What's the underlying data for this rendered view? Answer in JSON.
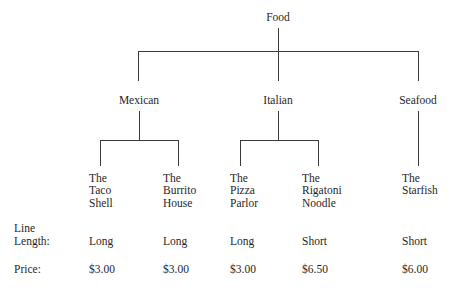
{
  "diagram": {
    "root": {
      "label": "Food",
      "x": 278,
      "y": 12
    },
    "level1": [
      {
        "label": "Mexican",
        "x": 139,
        "y": 95
      },
      {
        "label": "Italian",
        "x": 278,
        "y": 95
      },
      {
        "label": "Seafood",
        "x": 418,
        "y": 95
      }
    ],
    "leaves": [
      {
        "lines": [
          "The",
          "Taco",
          "Shell"
        ],
        "x": 89,
        "y": 172,
        "parent": "Mexican",
        "stem_x": 100
      },
      {
        "lines": [
          "The",
          "Burrito",
          "House"
        ],
        "x": 163,
        "y": 172,
        "parent": "Mexican",
        "stem_x": 178
      },
      {
        "lines": [
          "The",
          "Pizza",
          "Parlor"
        ],
        "x": 230,
        "y": 172,
        "parent": "Italian",
        "stem_x": 240
      },
      {
        "lines": [
          "The",
          "Rigatoni",
          "Noodle"
        ],
        "x": 302,
        "y": 172,
        "parent": "Italian",
        "stem_x": 318
      },
      {
        "lines": [
          "The",
          "Starfish"
        ],
        "x": 402,
        "y": 172,
        "parent": "Seafood",
        "stem_x": 418
      }
    ]
  },
  "table": {
    "row_labels": {
      "line_length_1": "Line",
      "line_length_2": "Length:",
      "price": "Price:"
    },
    "columns": [
      {
        "name": "The Taco Shell",
        "line_length": "Long",
        "price": "$3.00",
        "x": 89
      },
      {
        "name": "The Burrito House",
        "line_length": "Long",
        "price": "$3.00",
        "x": 163
      },
      {
        "name": "The Pizza Parlor",
        "line_length": "Long",
        "price": "$3.00",
        "x": 230
      },
      {
        "name": "The Rigatoni Noodle",
        "line_length": "Short",
        "price": "$6.50",
        "x": 302
      },
      {
        "name": "The Starfish",
        "line_length": "Short",
        "price": "$6.00",
        "x": 402
      }
    ]
  },
  "caption": {
    "text": ""
  },
  "colors": {
    "background": "#ffffff",
    "text": "#1f1f1f",
    "line": "#3a3a3a"
  }
}
